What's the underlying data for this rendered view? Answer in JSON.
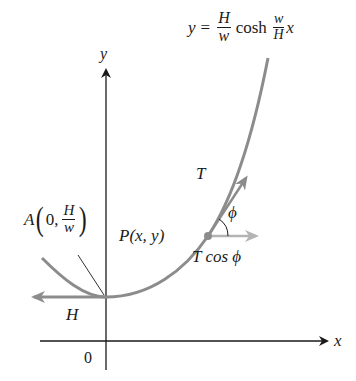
{
  "figure": {
    "title_equation": {
      "lhs": "y",
      "equals": "=",
      "coef_num": "H",
      "coef_den": "w",
      "func": "cosh",
      "arg_num": "w",
      "arg_den": "H",
      "var": "x"
    },
    "axes": {
      "x_label": "x",
      "y_label": "y",
      "origin_label": "0"
    },
    "point_A": {
      "name": "A",
      "x": "0,",
      "y_num": "H",
      "y_den": "w"
    },
    "point_P": {
      "label": "P(x, y)"
    },
    "vectors": {
      "tension": "T",
      "horizontal_component": "T cos ϕ",
      "horizontal_tension": "H",
      "angle": "ϕ"
    },
    "colors": {
      "curve": "#8c8c8c",
      "axes": "#1a1a1a",
      "tension_arrow": "#8c8c8c",
      "component_arrow": "#b4b4b4",
      "text": "#1a1a1a"
    }
  }
}
